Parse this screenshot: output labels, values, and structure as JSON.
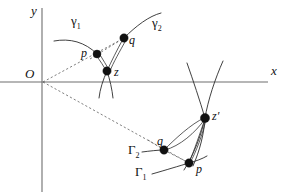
{
  "figure": {
    "type": "mathematical-diagram",
    "background_color": "#ffffff",
    "curve_color": "#2b2b2b",
    "axis_color": "#6e6e6e",
    "dash_color": "#555555",
    "dot_color": "#111111"
  },
  "axes": {
    "x_label": "x",
    "y_label": "y",
    "origin_label": "O",
    "x_axis": {
      "y": 82,
      "x_start": 0,
      "x_end": 268
    },
    "y_axis": {
      "x": 42,
      "y_start": 8,
      "y_end": 192
    }
  },
  "labels": {
    "gamma_1": {
      "base": "γ",
      "sub": "1",
      "x": 72,
      "y": 16
    },
    "gamma_2": {
      "base": "γ",
      "sub": "2",
      "x": 153,
      "y": 18
    },
    "Gamma_1": {
      "base": "Γ",
      "sub": "1",
      "x": 136,
      "y": 166
    },
    "Gamma_2": {
      "base": "Γ",
      "sub": "2",
      "x": 130,
      "y": 144
    },
    "p_upper": {
      "text": "p",
      "x": 82,
      "y": 49
    },
    "q_upper": {
      "text": "q",
      "x": 130,
      "y": 36
    },
    "z_upper": {
      "text": "z",
      "x": 115,
      "y": 68
    },
    "p_lower": {
      "text": "p",
      "x": 196,
      "y": 164
    },
    "q_lower": {
      "text": "q",
      "x": 158,
      "y": 136
    },
    "z_prime": {
      "text": "z′",
      "x": 212,
      "y": 111
    },
    "axis_x": {
      "text": "x",
      "x": 271,
      "y": 66
    },
    "axis_y": {
      "text": "y",
      "x": 31,
      "y": 6
    },
    "origin": {
      "text": "O",
      "x": 27,
      "y": 68
    }
  },
  "points": [
    {
      "name": "p-upper",
      "x": 97,
      "y": 54,
      "r": 4.0
    },
    {
      "name": "q-upper",
      "x": 124,
      "y": 38,
      "r": 4.2
    },
    {
      "name": "z-upper",
      "x": 107,
      "y": 71,
      "r": 4.2
    },
    {
      "name": "z-prime",
      "x": 205,
      "y": 118,
      "r": 4.6
    },
    {
      "name": "q-lower",
      "x": 164,
      "y": 150,
      "r": 4.2
    },
    {
      "name": "p-lower",
      "x": 189,
      "y": 163,
      "r": 4.2
    }
  ],
  "paths": {
    "gamma1_arc": "M 54 41 C 70 39 84 43 97 54",
    "gamma2_arc": "M 124 38 C 136 26 148 16 160 13",
    "cusp_left": "M 107 71 C 103 80 100 88 98 97",
    "cusp_right": "M 107 71 C 110 80 112 89 112 98",
    "edge_p_z_a": "M 97 54 L 107 71",
    "edge_p_z_b": "M 99 53 L 109 70",
    "edge_q_z_a": "M 124 38 L 107 71",
    "edge_q_z_b": "M 126 39 L 109 71",
    "ray_O_p_upper": "M 43 82 L 124 38",
    "ray_O_p_lower": "M 43 82 L 189 163",
    "dash_p_z_upper": "M 85 62 L 124 38",
    "dash_q_p_lower": "M 164 150 L 189 163",
    "zprime_cross_1": "M 186 64 C 193 80 200 100 205 118",
    "zprime_cross_2": "M 222 62 C 214 80 208 100 205 118",
    "zprime_down_1": "M 205 118 C 203 132 198 146 190 160",
    "zprime_down_2": "M 205 118 C 200 134 192 150 181 166",
    "fan_a": "M 205 118 C 192 126 176 140 164 150",
    "fan_b": "M 205 118 C 194 133 180 145 164 150",
    "fan_c": "M 205 118 C 200 134 194 152 189 163",
    "Gamma2_tail": "M 143 152 C 150 151 157 150 164 150",
    "Gamma1_tail": "M 152 173 C 165 170 178 166 189 163",
    "Gamma1_ext": "M 189 163 C 196 162 202 161 207 159"
  }
}
